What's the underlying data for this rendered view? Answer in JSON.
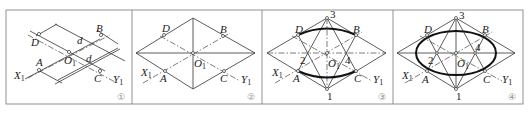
{
  "figure": {
    "panels": [
      {
        "id": "panel-1",
        "step_mark": "①",
        "labels": {
          "X": "X",
          "X_sub": "1",
          "Y": "Y",
          "Y_sub": "1",
          "O": "O",
          "O_sub": "1",
          "A": "A",
          "B": "B",
          "C": "C",
          "D": "D",
          "dim1": "d",
          "dim2": "d"
        }
      },
      {
        "id": "panel-2",
        "step_mark": "②",
        "labels": {
          "X": "X",
          "X_sub": "1",
          "Y": "Y",
          "Y_sub": "1",
          "O": "O",
          "O_sub": "1",
          "A": "A",
          "B": "B",
          "C": "C",
          "D": "D"
        }
      },
      {
        "id": "panel-3",
        "step_mark": "③",
        "labels": {
          "X": "X",
          "X_sub": "1",
          "Y": "Y",
          "Y_sub": "1",
          "O": "O",
          "O_sub": "1",
          "A": "A",
          "B": "B",
          "C": "C",
          "D": "D",
          "p1": "1",
          "p2": "2",
          "p3": "3",
          "p4": "4"
        }
      },
      {
        "id": "panel-4",
        "step_mark": "④",
        "labels": {
          "X": "X",
          "X_sub": "1",
          "Y": "Y",
          "Y_sub": "1",
          "O": "O",
          "O_sub": "1",
          "A": "A",
          "B": "B",
          "C": "C",
          "D": "D",
          "p1": "1",
          "p2": "2",
          "p3": "3",
          "p4": "4"
        }
      }
    ]
  }
}
